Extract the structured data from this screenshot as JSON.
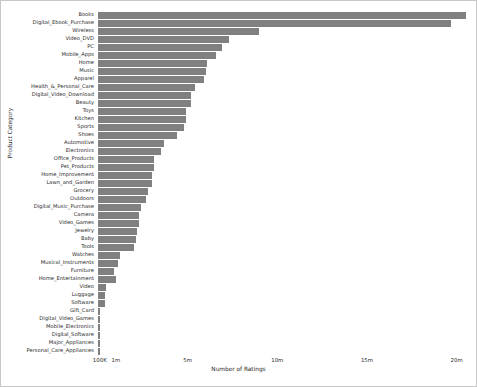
{
  "chart_data": {
    "type": "bar",
    "orientation": "horizontal",
    "title": "",
    "xlabel": "Number of Ratings",
    "ylabel": "Product Category",
    "xlim": [
      0,
      20800000
    ],
    "grid": false,
    "legend": null,
    "bar_color": "#808080",
    "xticks": [
      {
        "label": "100K",
        "value": 100000
      },
      {
        "label": "1m",
        "value": 1000000
      },
      {
        "label": "5m",
        "value": 5000000
      },
      {
        "label": "10m",
        "value": 10000000
      },
      {
        "label": "15m",
        "value": 15000000
      },
      {
        "label": "20m",
        "value": 20000000
      }
    ],
    "categories": [
      "Books",
      "Digital_Ebook_Purchase",
      "Wireless",
      "Video_DVD",
      "PC",
      "Mobile_Apps",
      "Home",
      "Music",
      "Apparel",
      "Health_&_Personal_Care",
      "Digital_Video_Download",
      "Beauty",
      "Toys",
      "Kitchen",
      "Sports",
      "Shoes",
      "Automotive",
      "Electronics",
      "Office_Products",
      "Pet_Products",
      "Home_Improvement",
      "Lawn_and_Garden",
      "Grocery",
      "Outdoors",
      "Digital_Music_Purchase",
      "Camera",
      "Video_Games",
      "Jewelry",
      "Baby",
      "Tools",
      "Watches",
      "Musical_Instruments",
      "Furniture",
      "Home_Entertainment",
      "Video",
      "Luggage",
      "Software",
      "Gift_Card",
      "Digital_Video_Games",
      "Mobile_Electronics",
      "Digital_Software",
      "Major_Appliances",
      "Personal_Care_Appliances"
    ],
    "values": [
      20500000,
      19700000,
      9000000,
      7300000,
      6900000,
      6600000,
      6100000,
      6000000,
      5900000,
      5400000,
      5200000,
      5200000,
      4900000,
      4900000,
      4800000,
      4400000,
      3700000,
      3500000,
      3100000,
      3100000,
      3000000,
      3000000,
      2800000,
      2700000,
      2400000,
      2300000,
      2300000,
      2200000,
      2100000,
      2000000,
      1200000,
      1100000,
      900000,
      1000000,
      450000,
      400000,
      380000,
      130000,
      110000,
      100000,
      95000,
      90000,
      85000
    ]
  }
}
